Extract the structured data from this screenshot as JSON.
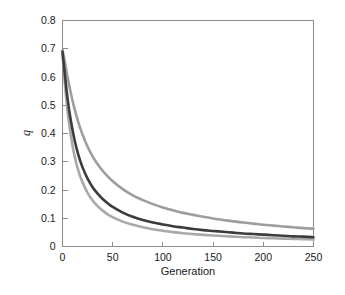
{
  "chart_data": {
    "type": "line",
    "title": "",
    "xlabel": "Generation",
    "ylabel": "q",
    "xlim": [
      0,
      250
    ],
    "ylim": [
      0,
      0.8
    ],
    "grid": false,
    "legend": "none",
    "x_ticks": [
      "0",
      "50",
      "100",
      "150",
      "200",
      "250"
    ],
    "x_tick_values": [
      0,
      50,
      100,
      150,
      200,
      250
    ],
    "y_ticks": [
      "0",
      "0.1",
      "0.2",
      "0.3",
      "0.4",
      "0.5",
      "0.6",
      "0.7",
      "0.8"
    ],
    "y_tick_values": [
      0,
      0.1,
      0.2,
      0.3,
      0.4,
      0.5,
      0.6,
      0.7,
      0.8
    ],
    "x": [
      0,
      2,
      5,
      8,
      12,
      16,
      20,
      25,
      30,
      35,
      40,
      45,
      50,
      60,
      70,
      80,
      90,
      100,
      110,
      120,
      130,
      140,
      150,
      160,
      170,
      180,
      190,
      200,
      210,
      220,
      230,
      240,
      250
    ],
    "series": [
      {
        "name": "upper",
        "color": "#9d9d9d",
        "width": 2.6,
        "values": [
          0.695,
          0.66,
          0.6,
          0.548,
          0.487,
          0.437,
          0.396,
          0.353,
          0.319,
          0.291,
          0.268,
          0.248,
          0.231,
          0.203,
          0.181,
          0.164,
          0.15,
          0.138,
          0.128,
          0.119,
          0.112,
          0.105,
          0.099,
          0.094,
          0.089,
          0.085,
          0.081,
          0.077,
          0.074,
          0.071,
          0.068,
          0.065,
          0.063
        ]
      },
      {
        "name": "middle",
        "color": "#3c3c3c",
        "width": 2.6,
        "values": [
          0.69,
          0.62,
          0.525,
          0.452,
          0.377,
          0.322,
          0.28,
          0.24,
          0.21,
          0.187,
          0.168,
          0.153,
          0.14,
          0.12,
          0.105,
          0.094,
          0.085,
          0.078,
          0.072,
          0.067,
          0.062,
          0.058,
          0.055,
          0.052,
          0.049,
          0.046,
          0.044,
          0.042,
          0.04,
          0.038,
          0.036,
          0.035,
          0.033
        ]
      },
      {
        "name": "lower",
        "color": "#a9a9a9",
        "width": 2.6,
        "values": [
          0.68,
          0.59,
          0.48,
          0.4,
          0.32,
          0.266,
          0.227,
          0.19,
          0.163,
          0.143,
          0.127,
          0.114,
          0.104,
          0.088,
          0.077,
          0.068,
          0.061,
          0.056,
          0.051,
          0.047,
          0.044,
          0.041,
          0.039,
          0.037,
          0.035,
          0.033,
          0.032,
          0.03,
          0.029,
          0.028,
          0.027,
          0.026,
          0.025
        ]
      }
    ]
  },
  "axis": {
    "x_title": "Generation",
    "y_title": "q"
  },
  "colors": {
    "frame": "#8c8c8c",
    "text": "#1a1a1a",
    "background": "#ffffff",
    "series_dark": "#3c3c3c",
    "series_light": "#9d9d9d"
  }
}
